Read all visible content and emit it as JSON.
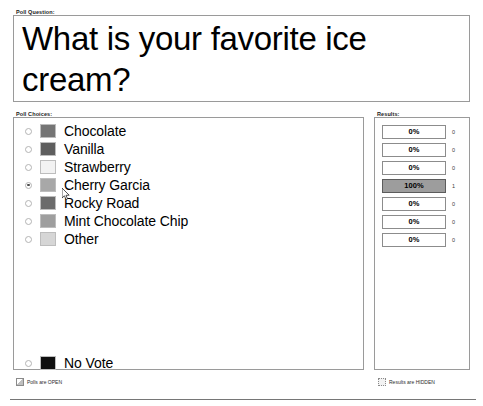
{
  "window": {
    "question_group_label": "Poll Question:",
    "choices_group_label": "Poll Choices:",
    "results_group_label": "Results:"
  },
  "question": {
    "text": "What is your favorite ice cream?"
  },
  "choices": [
    {
      "label": "Chocolate",
      "swatch": "#757575",
      "selected": false
    },
    {
      "label": "Vanilla",
      "swatch": "#5e5e5e",
      "selected": false
    },
    {
      "label": "Strawberry",
      "swatch": "#f2f2f2",
      "selected": false
    },
    {
      "label": "Cherry Garcia",
      "swatch": "#a8a8a8",
      "selected": true
    },
    {
      "label": "Rocky Road",
      "swatch": "#6b6b6b",
      "selected": false
    },
    {
      "label": "Mint Chocolate Chip",
      "swatch": "#9e9e9e",
      "selected": false
    },
    {
      "label": "Other",
      "swatch": "#d6d6d6",
      "selected": false
    }
  ],
  "no_vote": {
    "label": "No Vote",
    "swatch": "#101010",
    "selected": false
  },
  "results": [
    {
      "percent": "0%",
      "count": "0",
      "filled": false
    },
    {
      "percent": "0%",
      "count": "0",
      "filled": false
    },
    {
      "percent": "0%",
      "count": "0",
      "filled": false
    },
    {
      "percent": "100%",
      "count": "1",
      "filled": true
    },
    {
      "percent": "0%",
      "count": "0",
      "filled": false
    },
    {
      "percent": "0%",
      "count": "0",
      "filled": false
    },
    {
      "percent": "0%",
      "count": "0",
      "filled": false
    }
  ],
  "status": {
    "polls": "Polls are OPEN",
    "results": "Results are HIDDEN"
  },
  "colors": {
    "border": "#9a9a9a",
    "bar_fill": "#9d9d9d",
    "text": "#000000"
  }
}
